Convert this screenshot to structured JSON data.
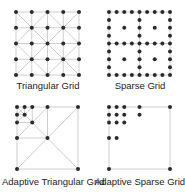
{
  "colors": {
    "background": "#ffffff",
    "line": "#c8c8c8",
    "dot": "#2b2b2b",
    "text": "#222222"
  },
  "panels": [
    {
      "id": "triangular",
      "caption": "Triangular Grid",
      "box": {
        "x": 16,
        "y": 12,
        "w": 63,
        "h": 63
      },
      "grid_n": 5,
      "caption_pos": {
        "x": 2,
        "y": 80
      }
    },
    {
      "id": "sparse",
      "caption": "Sparse Grid",
      "box": {
        "x": 109,
        "y": 12,
        "w": 61,
        "h": 63
      },
      "grid_n": 9,
      "points_norm": [
        [
          0,
          0
        ],
        [
          0.125,
          0
        ],
        [
          0.25,
          0
        ],
        [
          0.375,
          0
        ],
        [
          0.5,
          0
        ],
        [
          0.625,
          0
        ],
        [
          0.75,
          0
        ],
        [
          0.875,
          0
        ],
        [
          1,
          0
        ],
        [
          0,
          0.125
        ],
        [
          0.5,
          0.125
        ],
        [
          1,
          0.125
        ],
        [
          0,
          0.25
        ],
        [
          0.25,
          0.25
        ],
        [
          0.5,
          0.25
        ],
        [
          0.75,
          0.25
        ],
        [
          1,
          0.25
        ],
        [
          0,
          0.375
        ],
        [
          0.5,
          0.375
        ],
        [
          1,
          0.375
        ],
        [
          0,
          0.5
        ],
        [
          0.125,
          0.5
        ],
        [
          0.25,
          0.5
        ],
        [
          0.375,
          0.5
        ],
        [
          0.5,
          0.5
        ],
        [
          0.625,
          0.5
        ],
        [
          0.75,
          0.5
        ],
        [
          0.875,
          0.5
        ],
        [
          1,
          0.5
        ],
        [
          0,
          0.625
        ],
        [
          0.5,
          0.625
        ],
        [
          1,
          0.625
        ],
        [
          0,
          0.75
        ],
        [
          0.25,
          0.75
        ],
        [
          0.5,
          0.75
        ],
        [
          0.75,
          0.75
        ],
        [
          1,
          0.75
        ],
        [
          0,
          0.875
        ],
        [
          0.5,
          0.875
        ],
        [
          1,
          0.875
        ],
        [
          0,
          1
        ],
        [
          0.125,
          1
        ],
        [
          0.25,
          1
        ],
        [
          0.375,
          1
        ],
        [
          0.5,
          1
        ],
        [
          0.625,
          1
        ],
        [
          0.75,
          1
        ],
        [
          0.875,
          1
        ],
        [
          1,
          1
        ]
      ],
      "caption_pos": {
        "x": 94,
        "y": 80
      }
    },
    {
      "id": "adaptive-triangular",
      "caption": "Adaptive Triangular Grid",
      "box": {
        "x": 17,
        "y": 107,
        "w": 61,
        "h": 62
      },
      "points_norm": [
        [
          0,
          0
        ],
        [
          0.125,
          0
        ],
        [
          0.25,
          0
        ],
        [
          0.5,
          0
        ],
        [
          1,
          0
        ],
        [
          0,
          0.125
        ],
        [
          0.125,
          0.125
        ],
        [
          0,
          0.25
        ],
        [
          0.25,
          0.25
        ],
        [
          0,
          0.5
        ],
        [
          0.5,
          0.5
        ],
        [
          0,
          1
        ],
        [
          1,
          1
        ]
      ],
      "lines_norm": [
        [
          0,
          0,
          1,
          0
        ],
        [
          1,
          0,
          1,
          1
        ],
        [
          1,
          1,
          0,
          1
        ],
        [
          0,
          1,
          0,
          0
        ],
        [
          0,
          0,
          1,
          1
        ],
        [
          1,
          0,
          0,
          1
        ],
        [
          0.5,
          0,
          0.5,
          0.5
        ],
        [
          0,
          0.5,
          0.5,
          0.5
        ],
        [
          0.5,
          0,
          0,
          0.5
        ],
        [
          0.25,
          0,
          0.25,
          0.25
        ],
        [
          0,
          0.25,
          0.25,
          0.25
        ],
        [
          0.25,
          0,
          0,
          0.25
        ],
        [
          0.125,
          0,
          0.125,
          0.125
        ],
        [
          0,
          0.125,
          0.125,
          0.125
        ],
        [
          0.125,
          0,
          0,
          0.125
        ]
      ],
      "caption_pos": {
        "x": 2,
        "y": 176
      }
    },
    {
      "id": "adaptive-sparse",
      "caption": "Adaptive Sparse Grid",
      "box": {
        "x": 109,
        "y": 107,
        "w": 61,
        "h": 62
      },
      "points_norm": [
        [
          0,
          0
        ],
        [
          0.125,
          0
        ],
        [
          0.25,
          0
        ],
        [
          0.5,
          0
        ],
        [
          1,
          0
        ],
        [
          0,
          0.125
        ],
        [
          0.125,
          0.125
        ],
        [
          0.25,
          0.125
        ],
        [
          0.5,
          0.125
        ],
        [
          0,
          0.25
        ],
        [
          0.125,
          0.25
        ],
        [
          0.25,
          0.25
        ],
        [
          0,
          0.5
        ],
        [
          0.125,
          0.5
        ],
        [
          0,
          1
        ],
        [
          1,
          1
        ]
      ],
      "lines_norm": [
        [
          0,
          0,
          1,
          0
        ],
        [
          1,
          0,
          1,
          1
        ],
        [
          1,
          1,
          0,
          1
        ],
        [
          0,
          1,
          0,
          0
        ]
      ],
      "caption_pos": {
        "x": 94,
        "y": 176
      }
    }
  ]
}
